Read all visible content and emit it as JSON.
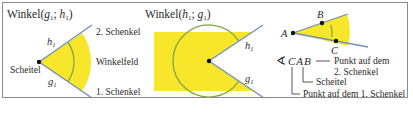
{
  "colors": {
    "fill": "#f7e629",
    "ray": "#6f8fbf",
    "arc": "#7fa64a",
    "point": "#111111",
    "text": "#2a2a2a",
    "border": "#8a8a8a"
  },
  "panel1": {
    "title_prefix": "Winkel(",
    "title_g": "g",
    "title_sep": "; ",
    "title_h": "h",
    "title_suffix": ")",
    "sub": "1",
    "label_h": "h",
    "label_g": "g",
    "vertex_label": "Scheitel",
    "field_label": "Winkelfeld",
    "leg2_label": "2. Schenkel",
    "leg1_label": "1. Schenkel"
  },
  "panel2": {
    "title_prefix": "Winkel(",
    "title_h": "h",
    "title_sep": "; ",
    "title_g": "g",
    "title_suffix": ")",
    "sub": "1",
    "label_h": "h",
    "label_g": "g"
  },
  "panel3": {
    "point_a": "A",
    "point_b": "B",
    "point_c": "C",
    "angle_symbol": "∢",
    "notation": "CAB",
    "annot_b_line1": "Punkt auf dem",
    "annot_b_line2": "2. Schenkel",
    "annot_a": "Scheitel",
    "annot_c": "Punkt auf dem 1. Schenkel"
  }
}
